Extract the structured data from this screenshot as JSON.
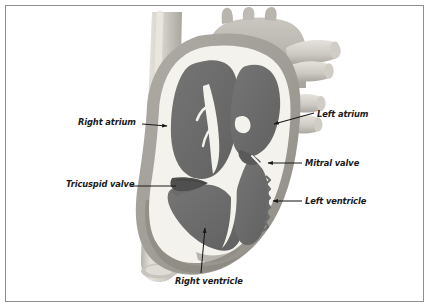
{
  "figure": {
    "type": "anatomical-diagram",
    "style": "grayscale medical illustration with thin gray border frame",
    "background_color": "#ffffff",
    "frame_color": "#8e8e8e"
  },
  "palette": {
    "chamber_blood": "#6b6b6b",
    "chamber_blood_dark": "#5e5e5e",
    "myocardium": "#a3a3a3",
    "myocardium_dark": "#8f8f8f",
    "endocardium": "#f2f0ea",
    "vessel_light": "#d8d6cf",
    "vessel_mid": "#bdbbb4",
    "vessel_shadow": "#9e9c95",
    "label_text": "#1a1a1a",
    "leader_line": "#1a1a1a"
  },
  "labels": [
    {
      "id": "right-atrium",
      "text": "Right atrium",
      "side": "left",
      "text_x": 78,
      "text_y": 118,
      "leader_from": [
        142,
        124
      ],
      "leader_to": [
        167,
        126
      ],
      "arrow": true
    },
    {
      "id": "tricuspid-valve",
      "text": "Tricuspid valve",
      "side": "left",
      "text_x": 66,
      "text_y": 180,
      "leader_from": [
        131,
        186
      ],
      "leader_to": [
        172,
        186
      ],
      "arrow": false
    },
    {
      "id": "right-ventricle",
      "text": "Right ventricle",
      "side": "bottom",
      "text_x": 175,
      "text_y": 277,
      "leader_from": [
        201,
        273
      ],
      "leader_to": [
        205,
        227
      ],
      "arrow": true
    },
    {
      "id": "left-atrium",
      "text": "Left atrium",
      "side": "right",
      "text_x": 317,
      "text_y": 110,
      "leader_from": [
        312,
        113
      ],
      "leader_to": [
        272,
        124
      ],
      "arrow": true
    },
    {
      "id": "mitral-valve",
      "text": "Mitral valve",
      "side": "right",
      "text_x": 305,
      "text_y": 159,
      "leader_from": [
        300,
        163
      ],
      "leader_to": [
        267,
        163
      ],
      "arrow": true
    },
    {
      "id": "left-ventricle",
      "text": "Left ventricle",
      "side": "right",
      "text_x": 305,
      "text_y": 197,
      "leader_from": [
        300,
        201
      ],
      "leader_to": [
        272,
        201
      ],
      "arrow": true
    }
  ],
  "structures": [
    {
      "id": "superior-vena-cava",
      "name": "Superior vena cava",
      "labeled": false
    },
    {
      "id": "inferior-vena-cava",
      "name": "Inferior vena cava",
      "labeled": false
    },
    {
      "id": "aortic-arch",
      "name": "Aortic arch",
      "labeled": false
    },
    {
      "id": "brachiocephalic-branches",
      "name": "Aortic arch branch vessels",
      "count": 3,
      "labeled": false
    },
    {
      "id": "pulmonary-artery",
      "name": "Pulmonary artery",
      "labeled": false
    },
    {
      "id": "pulmonary-veins",
      "name": "Pulmonary veins",
      "count": 3,
      "labeled": false
    },
    {
      "id": "right-atrium-chamber",
      "name": "Right atrium",
      "labeled": true
    },
    {
      "id": "left-atrium-chamber",
      "name": "Left atrium",
      "labeled": true
    },
    {
      "id": "right-ventricle-chamber",
      "name": "Right ventricle",
      "labeled": true
    },
    {
      "id": "left-ventricle-chamber",
      "name": "Left ventricle",
      "labeled": true
    },
    {
      "id": "tricuspid-valve-leaflet",
      "name": "Tricuspid valve",
      "labeled": true
    },
    {
      "id": "mitral-valve-leaflet",
      "name": "Mitral valve",
      "labeled": true
    },
    {
      "id": "interventricular-septum",
      "name": "Interventricular septum",
      "labeled": false
    },
    {
      "id": "apex",
      "name": "Apex of the heart",
      "labeled": false
    }
  ]
}
